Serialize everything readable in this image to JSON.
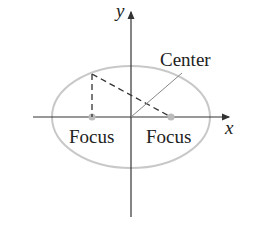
{
  "diagram": {
    "axes": {
      "x_label": "x",
      "y_label": "y"
    },
    "labels": {
      "center": "Center",
      "focus_left": "Focus",
      "focus_right": "Focus"
    },
    "colors": {
      "ellipse": "#c8c8c8",
      "axes": "#333333",
      "dashed": "#333333",
      "leader": "#888888",
      "focus_dot": "#bbbbbb"
    }
  }
}
